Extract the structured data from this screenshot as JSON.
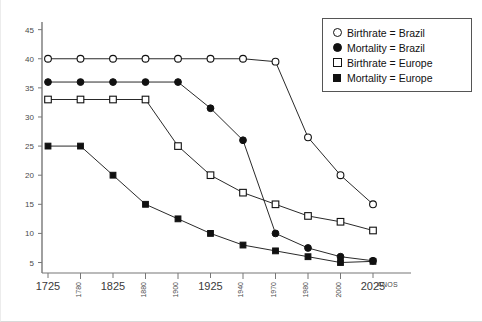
{
  "chart_data": {
    "type": "line",
    "title": "",
    "xlabel": "ANOS",
    "ylabel": "",
    "x": [
      1725,
      1780,
      1825,
      1880,
      1900,
      1925,
      1940,
      1970,
      1980,
      2000,
      2025
    ],
    "xtick_labels": [
      "1725",
      "1780",
      "1825",
      "1880",
      "1900",
      "1925",
      "1940",
      "1970",
      "1980",
      "2000",
      "2025"
    ],
    "xtick_orientation": [
      "horizontal",
      "vertical",
      "horizontal",
      "vertical",
      "vertical",
      "horizontal",
      "vertical",
      "vertical",
      "vertical",
      "vertical",
      "horizontal"
    ],
    "ytick_labels": [
      "5",
      "10",
      "15",
      "20",
      "25",
      "30",
      "35",
      "40",
      "45"
    ],
    "yticks": [
      5,
      10,
      15,
      20,
      25,
      30,
      35,
      40,
      45
    ],
    "ylim": [
      3.2,
      47
    ],
    "xlim": [
      1715,
      2040
    ],
    "grid": false,
    "legend_position": "top-right",
    "series": [
      {
        "name": "Birthrate = Brazil",
        "marker": "circle-open",
        "color": "#111111",
        "values": [
          40,
          40,
          40,
          40,
          40,
          40,
          40,
          39.5,
          26.5,
          20,
          15
        ]
      },
      {
        "name": "Mortality = Brazil",
        "marker": "circle-filled",
        "color": "#111111",
        "values": [
          36,
          36,
          36,
          36,
          36,
          31.5,
          26,
          10,
          7.5,
          6,
          5.3
        ]
      },
      {
        "name": "Birthrate = Europe",
        "marker": "square-open",
        "color": "#111111",
        "values": [
          33,
          33,
          33,
          33,
          25,
          20,
          17,
          15,
          13,
          12,
          10.5
        ]
      },
      {
        "name": "Mortality = Europe",
        "marker": "square-filled",
        "color": "#111111",
        "values": [
          25,
          25,
          20,
          15,
          12.5,
          10,
          8,
          7,
          6,
          5,
          5.2
        ]
      }
    ]
  },
  "legend": {
    "items": [
      {
        "label": "Birthrate = Brazil",
        "marker": "circle-open"
      },
      {
        "label": "Mortality = Brazil",
        "marker": "circle-filled"
      },
      {
        "label": "Birthrate = Europe",
        "marker": "square-open"
      },
      {
        "label": "Mortality = Europe",
        "marker": "square-filled"
      }
    ]
  }
}
